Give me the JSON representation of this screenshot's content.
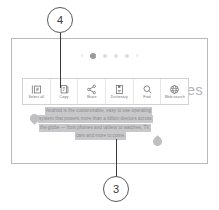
{
  "figure": {
    "callouts": [
      {
        "number": "4",
        "points_to": "copy-toolbar-item"
      },
      {
        "number": "3",
        "points_to": "selected-text-block"
      }
    ]
  },
  "screen": {
    "pager": {
      "prev_arrow": "‹",
      "next_arrow": "›",
      "dot_count": 4,
      "active_index": 0
    },
    "page_headline_fragment": "tes"
  },
  "selection_toolbar": {
    "items": [
      {
        "label": "Select all",
        "icon": "select-all-icon"
      },
      {
        "label": "Copy",
        "icon": "copy-icon"
      },
      {
        "label": "Share",
        "icon": "share-icon"
      },
      {
        "label": "Dictionary",
        "icon": "dictionary-icon"
      },
      {
        "label": "Find",
        "icon": "find-icon"
      },
      {
        "label": "Web search",
        "icon": "web-search-icon"
      }
    ]
  },
  "selected_text": {
    "lines": [
      "Android is the customizable, easy to use operating",
      "system that powers more than a billion devices across",
      "the globe — from phones and tablets to watches, TV,",
      "cars and more to come."
    ],
    "highlight_color": "#c8c8ca",
    "handle_color": "#bfbfc1"
  },
  "colors": {
    "callout_stroke": "#58595b",
    "leader_line": "#3b3b3d",
    "frame_border": "#b9b9bb",
    "toolbar_border": "#d2d2d4",
    "icon": "#6d6e70"
  }
}
